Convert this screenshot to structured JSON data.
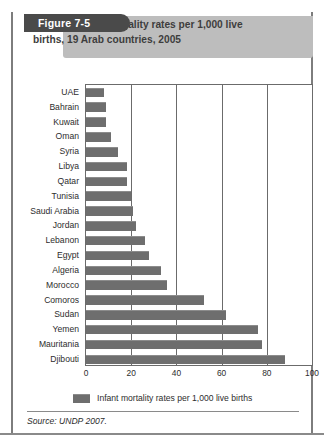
{
  "figure": {
    "tag": "Figure 7-5",
    "title_line1": "Infant mortality rates per 1,000 live",
    "title_line2": "births, 19 Arab countries, 2005",
    "source": "Source: UNDP 2007."
  },
  "legend": {
    "label": "Infant mortality rates per 1,000 live births",
    "swatch_color": "#6e6e6e"
  },
  "colors": {
    "bar": "#6e6e6e",
    "bar_highlight": "#8c8c8c",
    "tag_background": "#4a4a4a",
    "title_band": "#bdbdbd",
    "frame": "#6b6b6b",
    "text": "#2d2d2d"
  },
  "chart_data": {
    "type": "bar",
    "orientation": "horizontal",
    "title": "Infant mortality rates per 1,000 live births, 19 Arab countries, 2005",
    "xlabel": "",
    "ylabel": "",
    "xlim": [
      0,
      100
    ],
    "xticks": [
      0,
      20,
      40,
      60,
      80,
      100
    ],
    "xtick_labels": [
      "0",
      "20",
      "40",
      "60",
      "80",
      "100"
    ],
    "grid": "vertical",
    "legend_position": "bottom",
    "series_name": "Infant mortality rates per 1,000 live births",
    "categories": [
      "UAE",
      "Bahrain",
      "Kuwait",
      "Oman",
      "Syria",
      "Libya",
      "Qatar",
      "Tunisia",
      "Saudi Arabia",
      "Jordan",
      "Lebanon",
      "Egypt",
      "Algeria",
      "Morocco",
      "Comoros",
      "Sudan",
      "Yemen",
      "Mauritania",
      "Djibouti"
    ],
    "values": [
      8,
      9,
      9,
      11,
      14,
      18,
      18,
      20,
      21,
      22,
      26,
      28,
      33,
      36,
      52,
      62,
      76,
      78,
      88
    ]
  }
}
